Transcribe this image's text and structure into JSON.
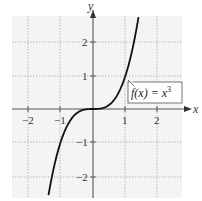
{
  "chart_data": {
    "type": "line",
    "title": "",
    "xlabel": "x",
    "ylabel": "y",
    "xlim": [
      -2.5,
      2.8
    ],
    "ylim": [
      -2.6,
      2.8
    ],
    "grid": true,
    "x_ticks": [
      -2,
      -1,
      1,
      2
    ],
    "y_ticks": [
      -2,
      -1,
      1,
      2
    ],
    "x_tick_labels": [
      "−2",
      "−1",
      "1",
      "2"
    ],
    "y_tick_labels": [
      "2",
      "1",
      "−1",
      "−2"
    ],
    "series": [
      {
        "name": "f(x) = x^3",
        "function": "x^3",
        "x": [
          -1.37,
          -1.2,
          -1.0,
          -0.8,
          -0.6,
          -0.4,
          -0.2,
          0,
          0.2,
          0.4,
          0.6,
          0.8,
          1.0,
          1.2,
          1.4
        ],
        "values": [
          -2.57,
          -1.728,
          -1.0,
          -0.512,
          -0.216,
          -0.064,
          -0.008,
          0,
          0.008,
          0.064,
          0.216,
          0.512,
          1.0,
          1.728,
          2.744
        ]
      }
    ],
    "annotations": [
      {
        "text_prefix": "f(x) = x",
        "exponent": "3",
        "points_to": [
          1.0,
          1.0
        ]
      }
    ]
  },
  "labels": {
    "x_axis": "x",
    "y_axis": "y",
    "function_prefix": "f(x) = x",
    "function_exponent": "3",
    "xt0": "−2",
    "xt1": "−1",
    "xt2": "1",
    "xt3": "2",
    "yt0": "2",
    "yt1": "1",
    "yt2": "−1",
    "yt3": "−2"
  }
}
